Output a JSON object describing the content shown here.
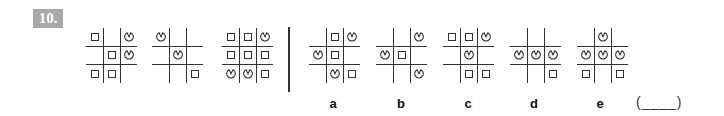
{
  "question": {
    "number": "10.",
    "answer_blank": "(____)"
  },
  "legend": {
    "S": "square-shape",
    "P": "pacman-shape",
    "_": "empty-cell"
  },
  "stimulus_figures": [
    {
      "id": "fig-1",
      "cells": [
        [
          "S",
          "_",
          "P"
        ],
        [
          "_",
          "S",
          "P"
        ],
        [
          "S",
          "S",
          "_"
        ]
      ]
    },
    {
      "id": "fig-2",
      "cells": [
        [
          "P",
          "_",
          "_"
        ],
        [
          "_",
          "P",
          "_"
        ],
        [
          "_",
          "_",
          "S"
        ]
      ]
    },
    {
      "id": "fig-3",
      "cells": [
        [
          "S",
          "S",
          "P"
        ],
        [
          "S",
          "S",
          "S"
        ],
        [
          "P",
          "P",
          "S"
        ]
      ]
    }
  ],
  "options": [
    {
      "label": "a",
      "cells": [
        [
          "_",
          "S",
          "P"
        ],
        [
          "P",
          "S",
          "_"
        ],
        [
          "_",
          "P",
          "S"
        ]
      ]
    },
    {
      "label": "b",
      "cells": [
        [
          "_",
          "_",
          "P"
        ],
        [
          "P",
          "S",
          "_"
        ],
        [
          "_",
          "_",
          "P"
        ]
      ]
    },
    {
      "label": "c",
      "cells": [
        [
          "S",
          "S",
          "P"
        ],
        [
          "_",
          "P",
          "_"
        ],
        [
          "_",
          "S",
          "S"
        ]
      ]
    },
    {
      "label": "d",
      "cells": [
        [
          "_",
          "_",
          "_"
        ],
        [
          "P",
          "P",
          "P"
        ],
        [
          "_",
          "_",
          "S"
        ]
      ]
    },
    {
      "label": "e",
      "cells": [
        [
          "_",
          "P",
          "_"
        ],
        [
          "P",
          "P",
          "P"
        ],
        [
          "S",
          "_",
          "S"
        ]
      ]
    }
  ],
  "colors": {
    "badge_bg": "#a9a9a9",
    "line": "#333333"
  }
}
